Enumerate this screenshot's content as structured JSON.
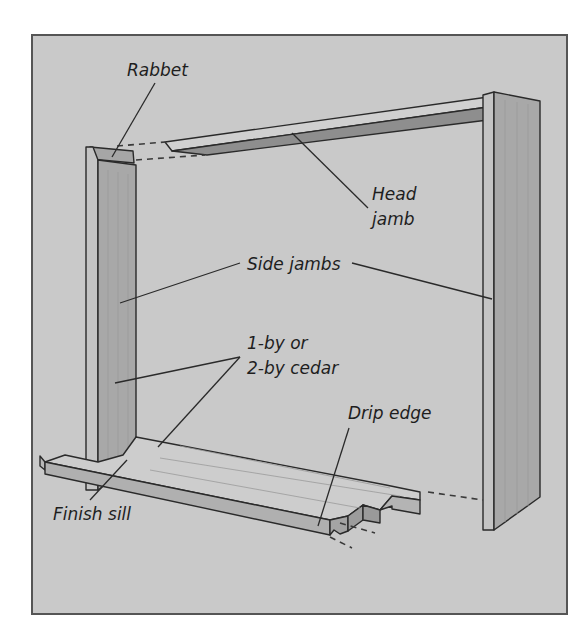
{
  "diagram": {
    "colors": {
      "page_background": "#ffffff",
      "panel_background": "#c9c9c9",
      "panel_border": "#555555",
      "wood_face": "#b3b3b3",
      "wood_light": "#d6d6d6",
      "wood_dark": "#8e8e8e",
      "line": "#2a2a2a"
    },
    "labels": {
      "rabbet": "Rabbet",
      "head_jamb_line1": "Head",
      "head_jamb_line2": "jamb",
      "side_jambs": "Side jambs",
      "material_line1": "1-by or",
      "material_line2": "2-by cedar",
      "drip_edge": "Drip edge",
      "finish_sill": "Finish sill"
    },
    "parts": [
      {
        "id": "head-jamb",
        "name": "Head jamb"
      },
      {
        "id": "left-side-jamb",
        "name": "Side jamb (left)"
      },
      {
        "id": "right-side-jamb",
        "name": "Side jamb (right)"
      },
      {
        "id": "finish-sill",
        "name": "Finish sill"
      },
      {
        "id": "rabbet",
        "name": "Rabbet"
      },
      {
        "id": "drip-edge",
        "name": "Drip edge"
      }
    ]
  }
}
